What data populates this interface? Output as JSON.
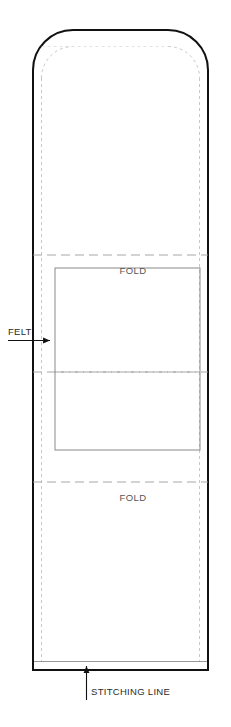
{
  "diagram": {
    "type": "sewing-pattern-technical-drawing",
    "title": "",
    "canvas": {
      "width": 231,
      "height": 727,
      "background": "#ffffff"
    },
    "colors": {
      "outline": "#111111",
      "seam_allowance": "#9a9a9a",
      "fold_line": "#8a8a8a",
      "felt_outline": "#8a8a8a",
      "label_text": "#555555",
      "leader_line": "#1a1a1a"
    },
    "outer_piece": {
      "name": "main-body-panel",
      "x": 33,
      "y": 30,
      "width": 175,
      "height": 640,
      "corner_radius_top": 40,
      "corner_radius_bottom": 0,
      "stroke_width": 2
    },
    "seam_allowance": {
      "name": "seam-allowance-guide",
      "inset": 8,
      "stroke_width": 0.8,
      "sides": [
        "left",
        "right",
        "bottom"
      ]
    },
    "fold_lines": [
      {
        "id": "fold-line-upper",
        "y": 255,
        "label": "FOLD",
        "label_x": 133,
        "label_y": 272
      },
      {
        "id": "center-line",
        "y": 372,
        "label": "",
        "label_x": 0,
        "label_y": 0
      },
      {
        "id": "fold-line-lower",
        "y": 482,
        "label": "FOLD",
        "label_x": 133,
        "label_y": 499
      }
    ],
    "felt_patch": {
      "name": "felt-patch-rectangle",
      "x": 55,
      "y": 268,
      "width": 145,
      "height": 182,
      "stroke_width": 1
    },
    "annotations": [
      {
        "id": "felt-annotation",
        "label": "FELT",
        "text_x": 8,
        "text_y": 334,
        "leader": {
          "x1": 8,
          "y1": 340,
          "x2": 52,
          "y2": 340
        },
        "arrow_direction": "right",
        "arrow_tip": {
          "x": 54,
          "y": 340
        }
      },
      {
        "id": "stitching-line-annotation",
        "label": "STITCHING LINE",
        "text_x": 90,
        "text_y": 694,
        "leader": {
          "x1": 86,
          "y1": 698,
          "x2": 86,
          "y2": 664
        },
        "arrow_direction": "up",
        "arrow_tip": {
          "x": 86,
          "y": 661
        }
      }
    ]
  }
}
